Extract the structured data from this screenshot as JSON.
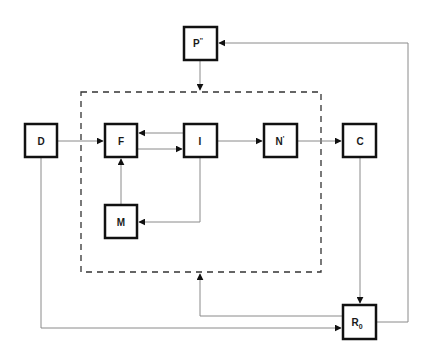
{
  "diagram": {
    "type": "flow-diagram",
    "colors": {
      "box_stroke": "#111111",
      "line": "#8a8a8a",
      "dashed": "#333333",
      "arrow": "#111111",
      "background": "#ffffff"
    },
    "nodes": {
      "p": {
        "label": "P",
        "superscript": "''",
        "x": 184,
        "y": 27,
        "w": 33,
        "h": 33
      },
      "d": {
        "label": "D",
        "x": 25,
        "y": 124,
        "w": 32,
        "h": 33
      },
      "f": {
        "label": "F",
        "x": 105,
        "y": 124,
        "w": 32,
        "h": 33
      },
      "i": {
        "label": "I",
        "x": 184,
        "y": 124,
        "w": 33,
        "h": 33
      },
      "n": {
        "label": "N",
        "superscript": "'",
        "x": 264,
        "y": 124,
        "w": 33,
        "h": 33
      },
      "c": {
        "label": "C",
        "x": 343,
        "y": 124,
        "w": 33,
        "h": 33
      },
      "m": {
        "label": "M",
        "x": 105,
        "y": 205,
        "w": 32,
        "h": 33
      },
      "r": {
        "label": "R",
        "subscript": "0",
        "x": 343,
        "y": 305,
        "w": 33,
        "h": 34
      }
    },
    "group": {
      "name": "dashed-boundary",
      "x": 81,
      "y": 92,
      "w": 240,
      "h": 180
    },
    "edges": [
      {
        "from": "P''",
        "to": "dashed-boundary"
      },
      {
        "from": "D",
        "to": "F"
      },
      {
        "from": "F",
        "to": "I"
      },
      {
        "from": "I",
        "to": "F"
      },
      {
        "from": "I",
        "to": "M"
      },
      {
        "from": "M",
        "to": "F"
      },
      {
        "from": "I",
        "to": "N'"
      },
      {
        "from": "N'",
        "to": "C"
      },
      {
        "from": "C",
        "to": "R0"
      },
      {
        "from": "D",
        "to": "R0"
      },
      {
        "from": "R0",
        "to": "dashed-boundary"
      },
      {
        "from": "R0",
        "to": "P''"
      }
    ]
  }
}
